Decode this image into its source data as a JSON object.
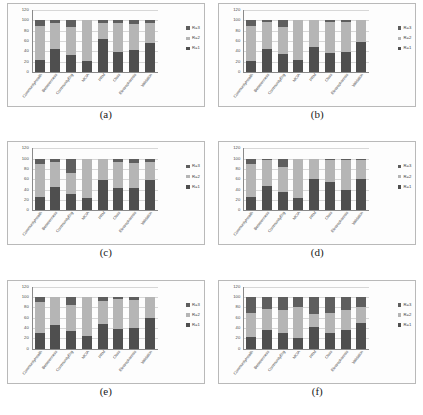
{
  "figure": {
    "panel_count": 6,
    "categories": [
      "CommunityHealth",
      "Betweenness",
      "CommunityEng",
      "MCIA",
      "PRM",
      "Closs",
      "Electrophoresis",
      "Validation"
    ],
    "y_ticks": [
      "120",
      "100",
      "80",
      "60",
      "40",
      "20",
      "0"
    ],
    "ylim": [
      0,
      120
    ],
    "legend_labels": [
      "R=3",
      "R=2",
      "R=1"
    ],
    "colors": {
      "r1": "#4f4f4f",
      "r2": "#b5b5b5",
      "r3": "#5e5e5e",
      "axis": "#8a8a8a",
      "gridline": "#d7d7d7",
      "frame": "#b9b9b9"
    }
  },
  "chart_data": [
    {
      "type": "bar",
      "caption": "(a)",
      "stacked": true,
      "title": "",
      "xlabel": "",
      "ylabel": "",
      "ylim": [
        0,
        120
      ],
      "yticks": [
        0,
        20,
        40,
        60,
        80,
        100,
        120
      ],
      "grid": true,
      "legend_position": "right",
      "categories": [
        "CommunityHealth",
        "Betweenness",
        "CommunityEng",
        "MCIA",
        "PRM",
        "Closs",
        "Electrophoresis",
        "Validation"
      ],
      "series": [
        {
          "name": "R=1",
          "values": [
            23,
            44,
            33,
            21,
            63,
            39,
            42,
            57
          ]
        },
        {
          "name": "R=2",
          "values": [
            67,
            51,
            55,
            79,
            31,
            55,
            51,
            38
          ]
        },
        {
          "name": "R=3",
          "values": [
            10,
            5,
            12,
            0,
            6,
            6,
            7,
            5
          ]
        }
      ]
    },
    {
      "type": "bar",
      "caption": "(b)",
      "stacked": true,
      "title": "",
      "xlabel": "",
      "ylabel": "",
      "ylim": [
        0,
        120
      ],
      "yticks": [
        0,
        20,
        40,
        60,
        80,
        100,
        120
      ],
      "grid": true,
      "legend_position": "right",
      "categories": [
        "CommunityHealth",
        "Betweenness",
        "CommunityEng",
        "MCIA",
        "PRM",
        "Closs",
        "Electrophoresis",
        "Validation"
      ],
      "series": [
        {
          "name": "R=1",
          "values": [
            22,
            44,
            34,
            24,
            48,
            37,
            38,
            59
          ]
        },
        {
          "name": "R=2",
          "values": [
            68,
            52,
            54,
            76,
            52,
            60,
            58,
            41
          ]
        },
        {
          "name": "R=3",
          "values": [
            10,
            4,
            12,
            0,
            0,
            3,
            4,
            0
          ]
        }
      ]
    },
    {
      "type": "bar",
      "caption": "(c)",
      "stacked": true,
      "title": "",
      "xlabel": "",
      "ylabel": "",
      "ylim": [
        0,
        120
      ],
      "yticks": [
        0,
        20,
        40,
        60,
        80,
        100,
        120
      ],
      "grid": true,
      "legend_position": "right",
      "categories": [
        "CommunityHealth",
        "Betweenness",
        "CommunityEng",
        "MCIA",
        "PRM",
        "Closs",
        "Electrophoresis",
        "Validation"
      ],
      "series": [
        {
          "name": "R=1",
          "values": [
            25,
            45,
            31,
            24,
            58,
            43,
            44,
            59
          ]
        },
        {
          "name": "R=2",
          "values": [
            65,
            48,
            41,
            76,
            42,
            51,
            48,
            34
          ]
        },
        {
          "name": "R=3",
          "values": [
            10,
            7,
            28,
            0,
            0,
            6,
            8,
            7
          ]
        }
      ]
    },
    {
      "type": "bar",
      "caption": "(d)",
      "stacked": true,
      "title": "",
      "xlabel": "",
      "ylabel": "",
      "ylim": [
        0,
        120
      ],
      "yticks": [
        0,
        20,
        40,
        60,
        80,
        100,
        120
      ],
      "grid": true,
      "legend_position": "right",
      "categories": [
        "CommunityHealth",
        "Betweenness",
        "CommunityEng",
        "MCIA",
        "PRM",
        "Closs",
        "Electrophoresis",
        "Validation"
      ],
      "series": [
        {
          "name": "R=1",
          "values": [
            25,
            47,
            35,
            24,
            60,
            55,
            39,
            61
          ]
        },
        {
          "name": "R=2",
          "values": [
            65,
            51,
            48,
            76,
            40,
            43,
            59,
            37
          ]
        },
        {
          "name": "R=3",
          "values": [
            10,
            2,
            17,
            0,
            0,
            2,
            2,
            2
          ]
        }
      ]
    },
    {
      "type": "bar",
      "caption": "(e)",
      "stacked": true,
      "title": "",
      "xlabel": "",
      "ylabel": "",
      "ylim": [
        0,
        120
      ],
      "yticks": [
        0,
        20,
        40,
        60,
        80,
        100,
        120
      ],
      "grid": true,
      "legend_position": "right",
      "categories": [
        "CommunityHealth",
        "Betweenness",
        "CommunityEng",
        "MCIA",
        "PRM",
        "Closs",
        "Electrophoresis",
        "Validation"
      ],
      "series": [
        {
          "name": "R=1",
          "values": [
            30,
            45,
            35,
            25,
            48,
            38,
            40,
            59
          ]
        },
        {
          "name": "R=2",
          "values": [
            60,
            55,
            50,
            75,
            44,
            58,
            54,
            41
          ]
        },
        {
          "name": "R=3",
          "values": [
            10,
            0,
            15,
            0,
            8,
            4,
            6,
            0
          ]
        }
      ]
    },
    {
      "type": "bar",
      "caption": "(f)",
      "stacked": true,
      "title": "",
      "xlabel": "",
      "ylabel": "",
      "ylim": [
        0,
        120
      ],
      "yticks": [
        0,
        20,
        40,
        60,
        80,
        100,
        120
      ],
      "grid": true,
      "legend_position": "right",
      "categories": [
        "CommunityHealth",
        "Betweenness",
        "CommunityEng",
        "MCIA",
        "PRM",
        "Closs",
        "Electrophoresis",
        "Validation"
      ],
      "series": [
        {
          "name": "R=1",
          "values": [
            22,
            37,
            30,
            20,
            42,
            31,
            36,
            50
          ]
        },
        {
          "name": "R=2",
          "values": [
            48,
            40,
            45,
            60,
            26,
            38,
            38,
            30
          ]
        },
        {
          "name": "R=3",
          "values": [
            30,
            23,
            25,
            20,
            32,
            31,
            26,
            20
          ]
        }
      ]
    }
  ]
}
